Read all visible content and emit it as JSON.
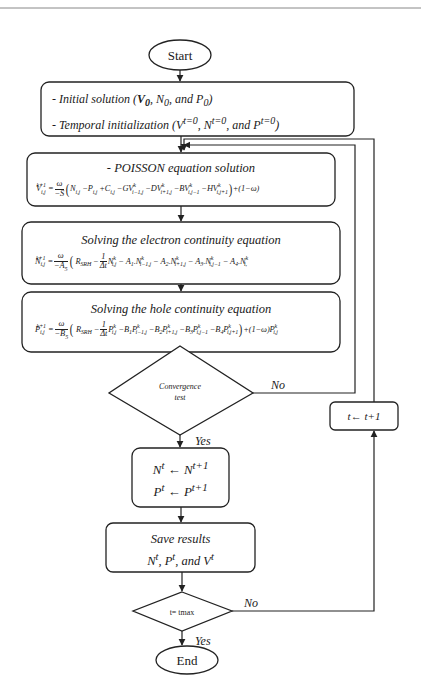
{
  "diagram": {
    "type": "flowchart",
    "colors": {
      "stroke": "#222222",
      "fill": "#ffffff",
      "text": "#1a1a1a"
    },
    "nodes": {
      "start": {
        "shape": "ellipse",
        "label": "Start"
      },
      "init": {
        "shape": "rounded-rect",
        "line1": "- Initial solution (V0, N0, and P0)",
        "line1_parts": {
          "prefix": "- Initial solution (",
          "v": "V",
          "v_sub": "0",
          "sep1": ", ",
          "n": "N",
          "n_sub": "0",
          "sep2": ", and ",
          "p": "P",
          "p_sub": "0",
          "suffix": ")"
        },
        "line2": "- Temporal initialization (V^t=0, N^t=0, and P^t=0)",
        "line2_parts": {
          "prefix": "- Temporal initialization (",
          "v": "V",
          "v_sup": "t=0",
          "sep1": ", ",
          "n": "N",
          "n_sup": "t=0",
          "sep2": ", and ",
          "p": "P",
          "p_sup": "t=0",
          "suffix": ")"
        }
      },
      "poisson": {
        "shape": "rounded-rect",
        "title": "- POISSON equation solution",
        "equation": "V_{i,j}^{k+1} = ω/(−S) ( N_{i,j} − P_{i,j} + C_{i,j} − G V_{i−1,j}^k − D V_{i+1,j}^k − B V_{i,j−1}^k − H V_{i,j+1}^k ) + (1−ω)"
      },
      "electron": {
        "shape": "rounded-rect",
        "title": "Solving the electron continuity equation",
        "equation": "N_{i,j}^{k+1} = ω/(−A5) ( R_SRH − (1/Δt) N_{i,j}^k − A1.N_{i−1,j}^k − A2.N_{i+1,j}^k − A3.N_{i,j−1}^k − A4.N_{i,}^k"
      },
      "hole": {
        "shape": "rounded-rect",
        "title": "Solving the hole continuity equation",
        "equation": "P_{i,j}^{k+1} = ω/(−B5) ( R_SRH − (1/Δt) P_{i,j}^k − B1 P_{i−1,j}^k − B2 P_{i+1,j}^k − B3 P_{i,j−1}^k − B4 P_{i,j+1}^k ) + (1−ω) P_{i,j}^k"
      },
      "convergence": {
        "shape": "diamond",
        "line1": "Convergence",
        "line2": "test"
      },
      "update": {
        "shape": "rounded-rect",
        "line1": "N^t ← N^(t+1)",
        "line2": "P^t ← P^(t+1)",
        "arrow": "←",
        "n": "N",
        "p": "P",
        "t": "t",
        "t_next": "t+1"
      },
      "save": {
        "shape": "rounded-rect",
        "line1": "Save results",
        "line2": "N^t, P^t, and V^t",
        "line2_parts": {
          "n": "N",
          "sep1": ", ",
          "p": "P",
          "sep2": ", and ",
          "v": "V",
          "sup": "t"
        }
      },
      "tmax": {
        "shape": "diamond",
        "label": "t= tmax"
      },
      "increment": {
        "shape": "rounded-rect",
        "label": "t← t+1"
      },
      "end": {
        "shape": "ellipse",
        "label": "End"
      }
    },
    "edges": [
      {
        "from": "start",
        "to": "init",
        "label": ""
      },
      {
        "from": "init",
        "to": "poisson",
        "label": ""
      },
      {
        "from": "poisson",
        "to": "electron",
        "label": ""
      },
      {
        "from": "electron",
        "to": "hole",
        "label": ""
      },
      {
        "from": "hole",
        "to": "convergence",
        "label": ""
      },
      {
        "from": "convergence",
        "to": "poisson",
        "label": "No"
      },
      {
        "from": "convergence",
        "to": "update",
        "label": "Yes"
      },
      {
        "from": "update",
        "to": "save",
        "label": ""
      },
      {
        "from": "save",
        "to": "tmax",
        "label": ""
      },
      {
        "from": "tmax",
        "to": "increment",
        "label": "No"
      },
      {
        "from": "increment",
        "to": "poisson",
        "label": ""
      },
      {
        "from": "tmax",
        "to": "end",
        "label": "Yes"
      }
    ],
    "edge_labels": {
      "no": "No",
      "yes": "Yes"
    }
  }
}
